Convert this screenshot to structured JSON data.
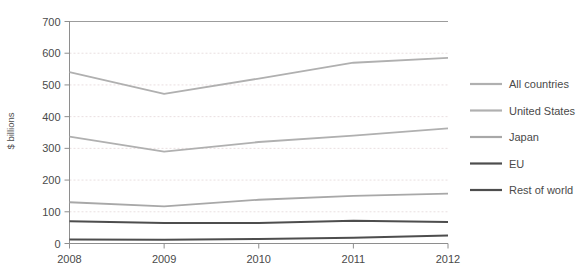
{
  "chart_data": {
    "type": "line",
    "title": "",
    "subtitle": "",
    "xlabel": "",
    "ylabel": "$ billions",
    "categories": [
      "2008",
      "2009",
      "2010",
      "2011",
      "2012"
    ],
    "x": [
      2008,
      2009,
      2010,
      2011,
      2012
    ],
    "xlim": [
      2008,
      2012
    ],
    "ylim": [
      0,
      700
    ],
    "yticks": [
      0,
      100,
      200,
      300,
      400,
      500,
      600,
      700
    ],
    "ytick_labels": [
      "0",
      "100",
      "200",
      "300",
      "400",
      "500",
      "600",
      "700"
    ],
    "xtick_labels": [
      "2008",
      "2009",
      "2010",
      "2011",
      "2012"
    ],
    "grid": "horizontal-dotted",
    "legend_position": "right",
    "series": [
      {
        "name": "All countries",
        "color": "#b0b0b0",
        "width": 1.8,
        "values": [
          540,
          472,
          520,
          570,
          585
        ]
      },
      {
        "name": "United States",
        "color": "#b0b0b0",
        "width": 1.8,
        "values": [
          337,
          290,
          320,
          340,
          363
        ]
      },
      {
        "name": "Japan",
        "color": "#a8a8a8",
        "width": 1.8,
        "values": [
          130,
          117,
          138,
          150,
          157
        ]
      },
      {
        "name": "EU",
        "color": "#4d4d4d",
        "width": 2.0,
        "values": [
          70,
          65,
          65,
          72,
          68
        ]
      },
      {
        "name": "Rest of world",
        "color": "#4d4d4d",
        "width": 2.0,
        "values": [
          13,
          12,
          14,
          18,
          25
        ]
      }
    ]
  },
  "legend": {
    "items": [
      {
        "label": "All countries"
      },
      {
        "label": "United States"
      },
      {
        "label": "Japan"
      },
      {
        "label": "EU"
      },
      {
        "label": "Rest of world"
      }
    ]
  },
  "colors": {
    "grid": "#e9dfe0",
    "axis": "#8e8e8e",
    "text": "#4a4a4a",
    "background": "#ffffff"
  }
}
